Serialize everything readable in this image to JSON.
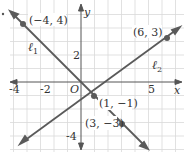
{
  "figure": {
    "type": "coordinate-plane",
    "axes": {
      "x_label": "x",
      "y_label": "y",
      "origin_label": "O"
    },
    "tick_labels": {
      "x": [
        "-4",
        "-2",
        "5"
      ],
      "y": [
        "2",
        "-4"
      ]
    },
    "lines": [
      {
        "name": "ℓ",
        "subscript": "1",
        "through": [
          [
            -4,
            4
          ],
          [
            1,
            -1
          ],
          [
            3,
            -3
          ]
        ]
      },
      {
        "name": "ℓ",
        "subscript": "2",
        "through": [
          [
            1,
            -1
          ],
          [
            6,
            3
          ]
        ]
      }
    ],
    "points": [
      {
        "label": "(−4, 4)"
      },
      {
        "label": "(6, 3)"
      },
      {
        "label": "(1, −1)"
      },
      {
        "label": "(3, −3)"
      }
    ],
    "colors": {
      "grid": "#d6d6d6",
      "axis": "#555555",
      "line": "#5a5a5a",
      "point": "#5a5a5a"
    }
  }
}
